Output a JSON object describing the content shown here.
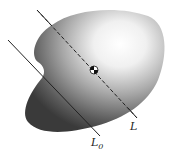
{
  "diagram": {
    "labels": {
      "axis_through_cm": "L",
      "parallel_axis": "L",
      "parallel_axis_subscript": "0"
    },
    "colors": {
      "body_dark": "#3a3a3a",
      "body_light": "#ffffff",
      "line": "#222222"
    }
  }
}
